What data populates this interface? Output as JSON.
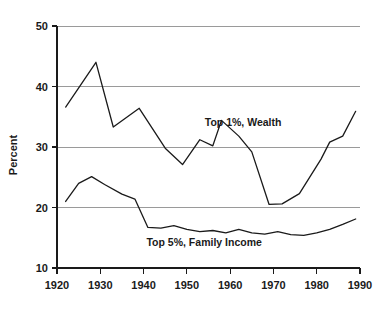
{
  "chart_data": {
    "type": "line",
    "title": "",
    "xlabel": "",
    "ylabel": "Percent",
    "xlim": [
      1920,
      1990
    ],
    "ylim": [
      10,
      50
    ],
    "grid": true,
    "gridlines_y": [
      20,
      30,
      40,
      50
    ],
    "legend_position": "inline-annotation",
    "xticks": [
      1920,
      1930,
      1940,
      1950,
      1960,
      1970,
      1980,
      1990
    ],
    "xtick_labels": [
      "1920",
      "1930",
      "1940",
      "1950",
      "1960",
      "1970",
      "1980",
      "1990"
    ],
    "yticks": [
      10,
      20,
      30,
      40,
      50
    ],
    "ytick_labels": [
      "10",
      "20",
      "30",
      "40",
      "50"
    ],
    "series": [
      {
        "name": "Top 1%, Wealth",
        "annotation": "Top 1%, Wealth",
        "annotation_x": 1963,
        "annotation_y": 33.4,
        "x": [
          1922,
          1929,
          1933,
          1939,
          1945,
          1949,
          1953,
          1956,
          1958,
          1962,
          1965,
          1969,
          1972,
          1976,
          1981,
          1983,
          1986,
          1989
        ],
        "values": [
          36.6,
          44.0,
          33.3,
          36.4,
          29.8,
          27.1,
          31.2,
          30.2,
          34.4,
          31.8,
          29.2,
          20.5,
          20.6,
          22.3,
          28.0,
          30.8,
          31.8,
          35.9
        ]
      },
      {
        "name": "Top 5%, Family Income",
        "annotation": "Top 5%, Family Income",
        "annotation_x": 1954,
        "annotation_y": 13.6,
        "x": [
          1922,
          1925,
          1928,
          1931,
          1935,
          1938,
          1941,
          1944,
          1947,
          1950,
          1953,
          1956,
          1959,
          1962,
          1965,
          1968,
          1971,
          1974,
          1977,
          1980,
          1983,
          1986,
          1989
        ],
        "values": [
          21.0,
          24.0,
          25.1,
          23.8,
          22.2,
          21.4,
          16.7,
          16.6,
          17.0,
          16.4,
          16.0,
          16.2,
          15.8,
          16.4,
          15.8,
          15.6,
          16.0,
          15.5,
          15.4,
          15.8,
          16.4,
          17.2,
          18.1
        ]
      }
    ]
  }
}
